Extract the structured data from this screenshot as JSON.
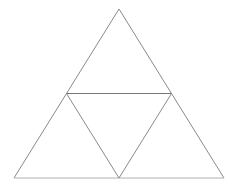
{
  "figure": {
    "background_color": "#ffffff",
    "canvas": {
      "width": 238,
      "height": 190
    },
    "stroke": {
      "outline_color": "#8a8a8a",
      "inner_color": "#777777",
      "baseline_color": "#b0b0b0",
      "width": 1
    },
    "vertices": {
      "apex": {
        "name": "apex",
        "x": 119,
        "y": 9
      },
      "bottom_left": {
        "name": "bottom-left",
        "x": 14,
        "y": 178
      },
      "bottom_right": {
        "name": "bottom-right",
        "x": 224,
        "y": 178
      },
      "left_midpoint": {
        "name": "left-midpoint",
        "x": 66.5,
        "y": 93.5
      },
      "right_midpoint": {
        "name": "right-midpoint",
        "x": 171.5,
        "y": 93.5
      },
      "bottom_midpoint": {
        "name": "bottom-midpoint",
        "x": 119,
        "y": 178
      }
    },
    "paths": {
      "outer_left_edge": "M 119 9 L 14 178",
      "outer_right_edge": "M 119 9 L 224 178",
      "outer_base_edge": "M 14 178 L 224 178",
      "midline_horizontal": "M 66.5 93.5 L 171.5 93.5",
      "inner_left_edge": "M 66.5 93.5 L 119 178",
      "inner_right_edge": "M 171.5 93.5 L 119 178"
    },
    "regions": [
      {
        "name": "top-triangle",
        "orientation": "upward"
      },
      {
        "name": "bottom-left-triangle",
        "orientation": "upward"
      },
      {
        "name": "bottom-right-triangle",
        "orientation": "upward"
      },
      {
        "name": "center-triangle",
        "orientation": "downward"
      }
    ]
  }
}
